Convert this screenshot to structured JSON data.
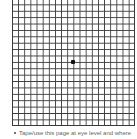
{
  "grid": {
    "type": "amsler-grid",
    "columns": 20,
    "line_color": "#3a3a3a",
    "center_dot_color": "#111111"
  },
  "instructions": [
    {
      "bullet": "•",
      "text": "Tape/use this page at eye level and where"
    }
  ]
}
